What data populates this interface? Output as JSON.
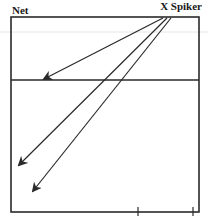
{
  "diagram": {
    "labels": {
      "net": "Net",
      "spiker": "X Spiker"
    },
    "colors": {
      "stroke": "#2a2a2a",
      "guide": "#e6e6e6",
      "background": "#ffffff"
    },
    "court": {
      "left": 11,
      "top": 17,
      "right": 199,
      "bottom": 212,
      "net_line_y": 80,
      "guide_line_y": 32,
      "bottom_ticks_x": [
        138,
        193
      ]
    },
    "arrows": [
      {
        "name": "spike-short",
        "from": [
          163,
          18
        ],
        "to": [
          44,
          79
        ]
      },
      {
        "name": "spike-mid",
        "from": [
          167,
          18
        ],
        "to": [
          19,
          165
        ]
      },
      {
        "name": "spike-deep",
        "from": [
          171,
          18
        ],
        "to": [
          33,
          191
        ]
      }
    ]
  }
}
